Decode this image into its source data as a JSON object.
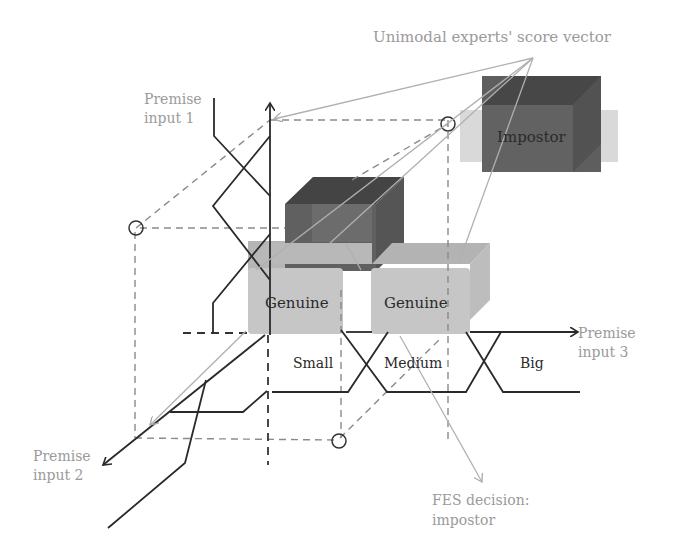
{
  "title": "Unimodal experts' score vector",
  "axes": {
    "input1": {
      "line1": "Premise",
      "line2": "input 1"
    },
    "input2": {
      "line1": "Premise",
      "line2": "input 2"
    },
    "input3": {
      "line1": "Premise",
      "line2": "input 3"
    }
  },
  "fuzzy_sets": {
    "small": "Small",
    "medium": "Medium",
    "big": "Big"
  },
  "boxes": {
    "impostor": "Impostor",
    "genuine_left": "Genuine",
    "genuine_right": "Genuine"
  },
  "decision": {
    "line1": "FES decision:",
    "line2": "impostor"
  },
  "colors": {
    "dark_box": "#5e5e5e",
    "dark_box_top": "#444444",
    "light_box": "#c4c4c4",
    "light_box_top": "#b0b0b0",
    "axis": "#2a2a2a",
    "annotation": "#a8a8a8",
    "dashed": "#8a8a8a"
  }
}
